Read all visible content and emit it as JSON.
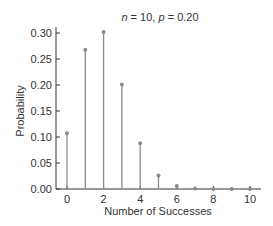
{
  "chart_data": {
    "type": "bar",
    "subtype": "stem",
    "title": "n = 10, p = 0.20",
    "title_parts": {
      "n_label": "n",
      "n_value": "10",
      "p_label": "p",
      "p_value": "0.20"
    },
    "xlabel": "Number of Successes",
    "ylabel": "Probability",
    "categories": [
      0,
      1,
      2,
      3,
      4,
      5,
      6,
      7,
      8,
      9,
      10
    ],
    "values": [
      0.107,
      0.268,
      0.302,
      0.201,
      0.088,
      0.026,
      0.006,
      0.001,
      0.0001,
      0.0,
      0.0
    ],
    "xticks": [
      "0",
      "2",
      "4",
      "6",
      "8",
      "10"
    ],
    "yticks": [
      "0.00",
      "0.05",
      "0.10",
      "0.15",
      "0.20",
      "0.25",
      "0.30"
    ],
    "xlim": [
      0,
      10
    ],
    "ylim": [
      0,
      0.3
    ],
    "grid": false,
    "legend": null,
    "colors": {
      "stem": "#8a8a8a",
      "marker": "#8a8a8a",
      "axis": "#333333"
    }
  }
}
